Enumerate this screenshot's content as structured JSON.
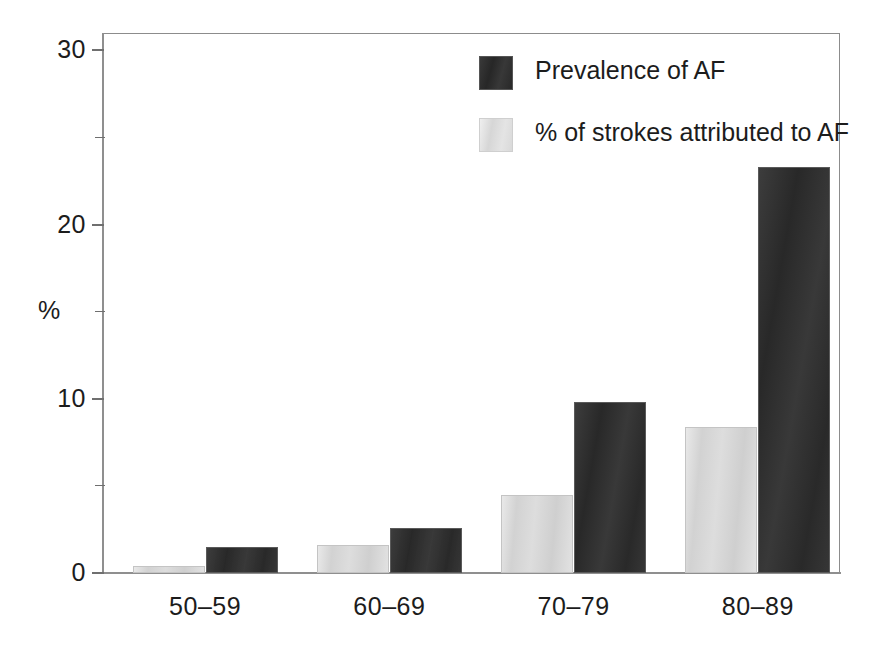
{
  "chart_data": {
    "type": "bar",
    "title": "",
    "xlabel": "",
    "ylabel": "%",
    "categories": [
      "50–59",
      "60–69",
      "70–79",
      "80–89"
    ],
    "series": [
      {
        "name": "Prevalence of AF",
        "color": "#2e2e2e",
        "values": [
          1.5,
          2.6,
          9.8,
          23.3
        ]
      },
      {
        "name": "% of strokes attributed to AF",
        "color": "#d9d9d9",
        "values": [
          0.4,
          1.6,
          4.5,
          8.4
        ]
      }
    ],
    "ylim": [
      0,
      31
    ],
    "yticks": [
      0,
      10,
      20,
      30
    ],
    "ytick_labels": [
      "0",
      "10",
      "20",
      "30"
    ],
    "yminor_ticks": [
      5,
      15,
      25
    ],
    "grid": false,
    "legend_position": "top-right",
    "frame": true
  },
  "axis": {
    "y_label": "%",
    "tick_labels": [
      "30",
      "20",
      "10",
      "0"
    ],
    "x_labels": [
      "50–59",
      "60–69",
      "70–79",
      "80–89"
    ]
  },
  "legend": {
    "items": [
      {
        "label": "Prevalence of AF",
        "swatch": "dark-swatch"
      },
      {
        "label": "% of strokes attributed to AF",
        "swatch": "light-swatch"
      }
    ]
  }
}
